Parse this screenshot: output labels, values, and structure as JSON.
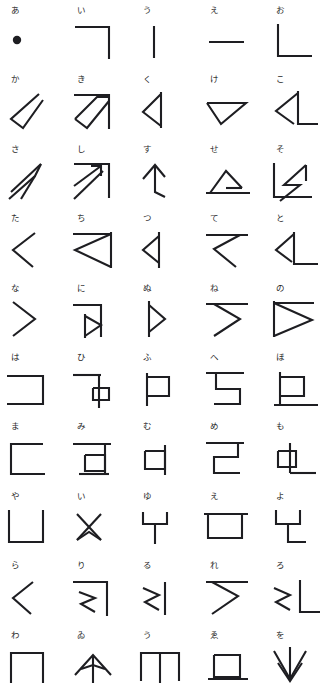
{
  "chart": {
    "type": "diagram",
    "title": "",
    "rows": 10,
    "columns": 5,
    "background_color": "#ffffff",
    "stroke_color": "#1e1e22",
    "label_color": "#2a2a2a",
    "stroke_width": 2.1
  },
  "cells": [
    {
      "label": "あ",
      "shape": "filled-dot",
      "romaji": "a"
    },
    {
      "label": "い",
      "shape": "corner-top-right",
      "romaji": "i"
    },
    {
      "label": "う",
      "shape": "vertical-bar",
      "romaji": "u"
    },
    {
      "label": "え",
      "shape": "horizontal-bar",
      "romaji": "e"
    },
    {
      "label": "お",
      "shape": "corner-bottom-left",
      "romaji": "o"
    },
    {
      "label": "か",
      "shape": "diag-hook-slash",
      "romaji": "ka"
    },
    {
      "label": "き",
      "shape": "diag-parallelogram-frame",
      "romaji": "ki"
    },
    {
      "label": "く",
      "shape": "left-triangle-bar",
      "romaji": "ku"
    },
    {
      "label": "け",
      "shape": "down-triangle",
      "romaji": "ke"
    },
    {
      "label": "こ",
      "shape": "triangle-with-foot",
      "romaji": "ko"
    },
    {
      "label": "さ",
      "shape": "double-diagonal-hook",
      "romaji": "sa"
    },
    {
      "label": "し",
      "shape": "diag-arrow-frame",
      "romaji": "shi"
    },
    {
      "label": "す",
      "shape": "arrowhead-stem",
      "romaji": "su"
    },
    {
      "label": "せ",
      "shape": "flat-triangle-base",
      "romaji": "se"
    },
    {
      "label": "そ",
      "shape": "zigzag-corner-frame",
      "romaji": "so"
    },
    {
      "label": "た",
      "shape": "chevron-left",
      "romaji": "ta"
    },
    {
      "label": "ち",
      "shape": "left-triangle-frame",
      "romaji": "chi"
    },
    {
      "label": "つ",
      "shape": "small-left-triangle-bar",
      "romaji": "tsu"
    },
    {
      "label": "て",
      "shape": "bar-chevron",
      "romaji": "te"
    },
    {
      "label": "と",
      "shape": "small-triangle-corner",
      "romaji": "to"
    },
    {
      "label": "な",
      "shape": "chevron-right",
      "romaji": "na"
    },
    {
      "label": "に",
      "shape": "bar-right-triangle",
      "romaji": "ni"
    },
    {
      "label": "ぬ",
      "shape": "small-right-triangle-bar",
      "romaji": "nu"
    },
    {
      "label": "ね",
      "shape": "bar-chevron-right",
      "romaji": "ne"
    },
    {
      "label": "の",
      "shape": "right-triangle-frame",
      "romaji": "no"
    },
    {
      "label": "は",
      "shape": "bracket-right",
      "romaji": "ha"
    },
    {
      "label": "ひ",
      "shape": "bar-box-stem",
      "romaji": "hi"
    },
    {
      "label": "ふ",
      "shape": "box-left-stem",
      "romaji": "fu"
    },
    {
      "label": "へ",
      "shape": "bar-s-hook",
      "romaji": "he"
    },
    {
      "label": "ほ",
      "shape": "box-stem-foot",
      "romaji": "ho"
    },
    {
      "label": "ま",
      "shape": "bracket-left",
      "romaji": "ma"
    },
    {
      "label": "み",
      "shape": "bar-box-foot",
      "romaji": "mi"
    },
    {
      "label": "む",
      "shape": "small-box-stem",
      "romaji": "mu"
    },
    {
      "label": "め",
      "shape": "bar-z-hook",
      "romaji": "me"
    },
    {
      "label": "も",
      "shape": "small-box-stem-foot",
      "romaji": "mo"
    },
    {
      "label": "や",
      "shape": "u-bracket",
      "romaji": "ya"
    },
    {
      "label": "い",
      "shape": "hourglass-cross",
      "romaji": "i"
    },
    {
      "label": "ゆ",
      "shape": "y-fork",
      "romaji": "yu"
    },
    {
      "label": "え",
      "shape": "open-box-top",
      "romaji": "e"
    },
    {
      "label": "よ",
      "shape": "y-fork-foot",
      "romaji": "yo"
    },
    {
      "label": "ら",
      "shape": "chevron-small-left",
      "romaji": "ra"
    },
    {
      "label": "り",
      "shape": "squiggle-corner-frame",
      "romaji": "ri"
    },
    {
      "label": "る",
      "shape": "squiggle-bar",
      "romaji": "ru"
    },
    {
      "label": "れ",
      "shape": "bar-squiggle",
      "romaji": "re"
    },
    {
      "label": "ろ",
      "shape": "squiggle-corner-foot",
      "romaji": "ro"
    },
    {
      "label": "わ",
      "shape": "n-bracket",
      "romaji": "wa"
    },
    {
      "label": "ゐ",
      "shape": "peak-arch",
      "romaji": "wi"
    },
    {
      "label": "う",
      "shape": "double-leg-bracket",
      "romaji": "u"
    },
    {
      "label": "ゑ",
      "shape": "box-on-base",
      "romaji": "we"
    },
    {
      "label": "を",
      "shape": "down-arrow-fork",
      "romaji": "wo"
    }
  ]
}
